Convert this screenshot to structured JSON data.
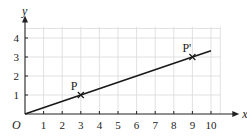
{
  "chart_data": {
    "type": "line",
    "title": "",
    "xlabel": "x",
    "ylabel": "y",
    "origin_label": "O",
    "xlim": [
      0,
      10.5
    ],
    "ylim": [
      0,
      4.6
    ],
    "x_ticks": [
      1,
      2,
      3,
      4,
      5,
      6,
      7,
      8,
      9,
      10
    ],
    "y_ticks": [
      1,
      2,
      3,
      4
    ],
    "grid": true,
    "series": [
      {
        "name": "line through O, P and P'",
        "x": [
          0,
          3,
          9,
          10
        ],
        "y": [
          0,
          1,
          3,
          3.33
        ]
      }
    ],
    "points": [
      {
        "label": "P",
        "x": 3,
        "y": 1
      },
      {
        "label": "P'",
        "x": 9,
        "y": 3
      }
    ],
    "colors": {
      "line": "#1a1a1a",
      "grid": "#d9d9d9",
      "axis": "#222222"
    }
  }
}
